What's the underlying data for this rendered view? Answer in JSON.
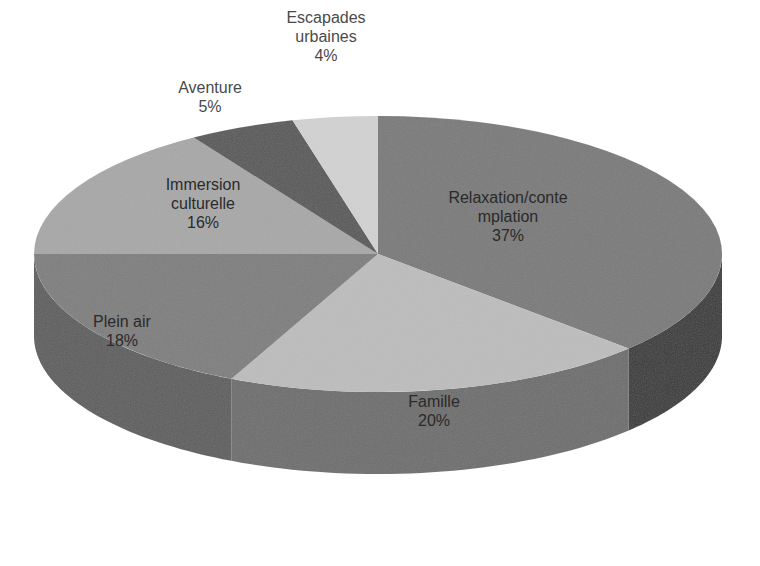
{
  "chart_data": {
    "type": "pie",
    "variant": "3d",
    "title": "",
    "start_angle_deg": 0,
    "direction": "clockwise",
    "legend": "none",
    "slices": [
      {
        "name": "Relaxation/contemplation",
        "label_lines": [
          "Relaxation/conte",
          "mplation",
          "37%"
        ],
        "value": 37,
        "color": "#7a7a7a",
        "side_color": "#3a3a3a",
        "label_pos": [
          508,
          188
        ],
        "outside": false
      },
      {
        "name": "Famille",
        "label_lines": [
          "Famille",
          "20%"
        ],
        "value": 20,
        "color": "#bdbdbd",
        "side_color": "#6e6e6e",
        "label_pos": [
          434,
          392
        ],
        "outside": false
      },
      {
        "name": "Plein air",
        "label_lines": [
          "Plein air",
          "18%"
        ],
        "value": 18,
        "color": "#7f7f7f",
        "side_color": "#5e5e5e",
        "label_pos": [
          122,
          312
        ],
        "outside": false
      },
      {
        "name": "Immersion culturelle",
        "label_lines": [
          "Immersion",
          "culturelle",
          "16%"
        ],
        "value": 16,
        "color": "#a8a8a8",
        "side_color": "#7a7a7a",
        "label_pos": [
          203,
          175
        ],
        "outside": false
      },
      {
        "name": "Aventure",
        "label_lines": [
          "Aventure",
          "5%"
        ],
        "value": 5,
        "color": "#5a5a5a",
        "side_color": "#3a3a3a",
        "label_pos": [
          210,
          78
        ],
        "outside": true
      },
      {
        "name": "Escapades urbaines",
        "label_lines": [
          "Escapades",
          "urbaines",
          "4%"
        ],
        "value": 4,
        "color": "#d2d2d2",
        "side_color": "#9a9a9a",
        "label_pos": [
          326,
          8
        ],
        "outside": true
      }
    ],
    "geometry": {
      "cx": 378,
      "cy": 254,
      "rx": 344,
      "ry": 138,
      "depth": 82
    }
  }
}
